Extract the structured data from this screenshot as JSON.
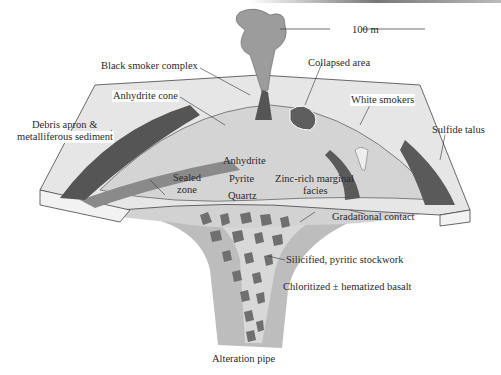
{
  "diagram": {
    "scale_bar": "100 m",
    "colors": {
      "basalt": "#bdbdbd",
      "pipe_core": "#d6d6d6",
      "surface": "#e3e3e3",
      "dark_sulfide": "#5c5c5c",
      "sealed_zone": "#8c8c8c",
      "mound": "#cfcfcf"
    },
    "labels": {
      "black_smoker_complex": "Black smoker complex",
      "anhydrite_cone": "Anhydrite cone",
      "debris_apron_line1": "Debris apron &",
      "debris_apron_line2": "metalliferous sediment",
      "collapsed_area": "Collapsed area",
      "white_smokers": "White smokers",
      "sulfide_talus": "Sulfide talus",
      "sealed_zone_line1": "Sealed",
      "sealed_zone_line2": "zone",
      "anhydrite": "Anhydrite",
      "pyrite": "Pyrite",
      "quartz": "Quartz",
      "zinc_rich_line1": "Zinc-rich marginal",
      "zinc_rich_line2": "facies",
      "gradational_contact": "Gradational contact",
      "stockwork": "Silicified, pyritic stockwork",
      "basalt": "Chloritized ± hematized basalt",
      "alteration_pipe": "Alteration pipe"
    }
  }
}
